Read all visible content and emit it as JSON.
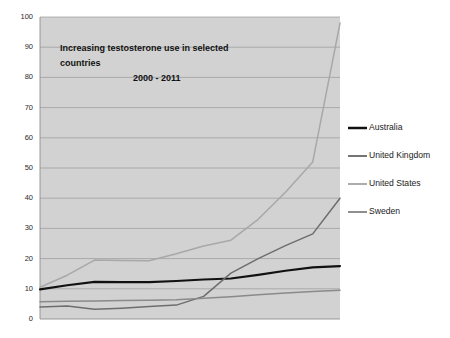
{
  "chart_data": {
    "type": "line",
    "title": "Increasing testosterone use in selected countries",
    "subtitle": "2000 - 2011",
    "xlabel": "",
    "ylabel": "",
    "ylim": [
      0,
      100
    ],
    "xlim": [
      2000,
      2011
    ],
    "grid": true,
    "legend_position": "right",
    "ytick_labels": [
      "100",
      "90",
      "80",
      "70",
      "60",
      "50",
      "40",
      "30",
      "20",
      "10",
      "0"
    ],
    "ytick_values": [
      100,
      90,
      80,
      70,
      60,
      50,
      40,
      30,
      20,
      10,
      0
    ],
    "xtick_labels": [],
    "x": [
      2000,
      2001,
      2002,
      2003,
      2004,
      2005,
      2006,
      2007,
      2008,
      2009,
      2010,
      2011
    ],
    "series": [
      {
        "name": "Australia",
        "color": "#111111",
        "width": 2.1,
        "values": [
          9.8,
          11.2,
          12.3,
          12.2,
          12.2,
          12.6,
          13.1,
          13.4,
          14.6,
          16.0,
          17.1,
          17.5
        ]
      },
      {
        "name": "United Kingdom",
        "color": "#6d6d6d",
        "width": 1.5,
        "values": [
          4.0,
          4.3,
          3.2,
          3.6,
          4.1,
          4.6,
          7.5,
          15.2,
          20.0,
          24.3,
          28.2,
          40.0
        ]
      },
      {
        "name": "United States",
        "color": "#a8a8a8",
        "width": 1.5,
        "values": [
          10.5,
          14.5,
          19.5,
          19.4,
          19.3,
          21.6,
          24.2,
          26.1,
          33.0,
          42.0,
          52.0,
          98.0
        ]
      },
      {
        "name": "Sweden",
        "color": "#8a8a8a",
        "width": 1.5,
        "values": [
          5.7,
          5.9,
          6.0,
          6.1,
          6.2,
          6.4,
          6.9,
          7.4,
          8.0,
          8.6,
          9.1,
          9.5
        ]
      }
    ]
  },
  "legend": {
    "entries": [
      {
        "label": "Australia"
      },
      {
        "label": "United Kingdom"
      },
      {
        "label": "United States"
      },
      {
        "label": "Sweden"
      }
    ]
  },
  "title_block": {
    "line1": "Increasing testosterone use in selected",
    "line2": "countries",
    "line3": "2000 - 2011"
  }
}
